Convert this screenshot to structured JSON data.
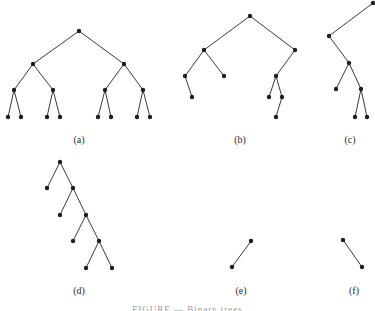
{
  "figure": {
    "caption": "FIGURE — Binary trees",
    "node_color": "#1e1e1e",
    "edge_color": "#3a3a3a",
    "trees": [
      {
        "label": "(a)",
        "label_pos": [
          79,
          143
        ],
        "nodes": [
          [
            79,
            31
          ],
          [
            33,
            64
          ],
          [
            124,
            64
          ],
          [
            14,
            90
          ],
          [
            53,
            90
          ],
          [
            105,
            90
          ],
          [
            143,
            90
          ],
          [
            8,
            117
          ],
          [
            21,
            117
          ],
          [
            47,
            117
          ],
          [
            60,
            117
          ],
          [
            98,
            117
          ],
          [
            111,
            117
          ],
          [
            137,
            117
          ],
          [
            150,
            117
          ]
        ],
        "edges": [
          [
            0,
            1
          ],
          [
            0,
            2
          ],
          [
            1,
            3
          ],
          [
            1,
            4
          ],
          [
            2,
            5
          ],
          [
            2,
            6
          ],
          [
            3,
            7
          ],
          [
            3,
            8
          ],
          [
            4,
            9
          ],
          [
            4,
            10
          ],
          [
            5,
            11
          ],
          [
            5,
            12
          ],
          [
            6,
            13
          ],
          [
            6,
            14
          ]
        ]
      },
      {
        "label": "(b)",
        "label_pos": [
          240,
          143
        ],
        "nodes": [
          [
            250,
            16
          ],
          [
            204,
            50
          ],
          [
            295,
            50
          ],
          [
            185,
            76
          ],
          [
            224,
            76
          ],
          [
            192,
            97
          ],
          [
            276,
            76
          ],
          [
            269,
            97
          ],
          [
            282,
            97
          ],
          [
            276,
            117
          ]
        ],
        "edges": [
          [
            0,
            1
          ],
          [
            0,
            2
          ],
          [
            1,
            3
          ],
          [
            1,
            4
          ],
          [
            3,
            5
          ],
          [
            2,
            6
          ],
          [
            6,
            7
          ],
          [
            6,
            8
          ],
          [
            8,
            9
          ]
        ]
      },
      {
        "label": "(c)",
        "label_pos": [
          350,
          143
        ],
        "nodes": [
          [
            373,
            3
          ],
          [
            329,
            36
          ],
          [
            349,
            63
          ],
          [
            336,
            89
          ],
          [
            361,
            89
          ],
          [
            355,
            117
          ],
          [
            367,
            117
          ]
        ],
        "edges": [
          [
            0,
            1
          ],
          [
            1,
            2
          ],
          [
            2,
            3
          ],
          [
            2,
            4
          ],
          [
            4,
            5
          ],
          [
            4,
            6
          ]
        ]
      },
      {
        "label": "(d)",
        "label_pos": [
          79,
          294
        ],
        "nodes": [
          [
            60,
            162
          ],
          [
            47,
            188
          ],
          [
            73,
            188
          ],
          [
            60,
            215
          ],
          [
            86,
            215
          ],
          [
            73,
            241
          ],
          [
            99,
            241
          ],
          [
            86,
            268
          ],
          [
            112,
            268
          ]
        ],
        "edges": [
          [
            0,
            1
          ],
          [
            0,
            2
          ],
          [
            2,
            3
          ],
          [
            2,
            4
          ],
          [
            4,
            5
          ],
          [
            4,
            6
          ],
          [
            6,
            7
          ],
          [
            6,
            8
          ]
        ]
      },
      {
        "label": "(e)",
        "label_pos": [
          241,
          294
        ],
        "nodes": [
          [
            251,
            241
          ],
          [
            232,
            267
          ]
        ],
        "edges": [
          [
            0,
            1
          ]
        ]
      },
      {
        "label": "(f)",
        "label_pos": [
          354,
          294
        ],
        "nodes": [
          [
            343,
            240
          ],
          [
            362,
            267
          ]
        ],
        "edges": [
          [
            0,
            1
          ]
        ]
      }
    ]
  }
}
